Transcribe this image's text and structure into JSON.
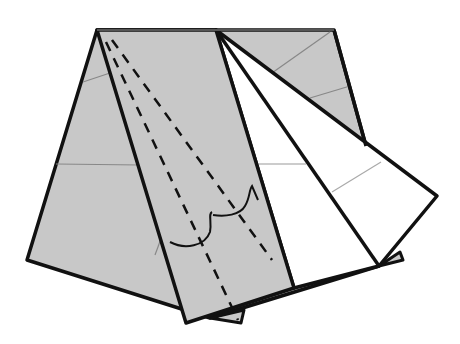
{
  "diagram": {
    "type": "origami-fold-step",
    "title": "Origami folding step",
    "colors": {
      "paper_colored": "#c8c8c8",
      "paper_white": "#ffffff",
      "outline": "#111111",
      "crease": "#888888",
      "valley_fold": "#111111",
      "background": "#ffffff"
    },
    "elements": [
      {
        "name": "back-sheet",
        "kind": "gray trapezoid layer"
      },
      {
        "name": "center-strip",
        "kind": "gray strip with valley-fold lines"
      },
      {
        "name": "white-flaps",
        "kind": "two white triangular flaps fanned right"
      },
      {
        "name": "kite-flap",
        "kind": "white kite flap pointing right"
      },
      {
        "name": "valley-fold-lines",
        "kind": "two dashed lines from apex"
      },
      {
        "name": "fold-arrows",
        "kind": "two curved arrows indicating fold"
      }
    ]
  }
}
